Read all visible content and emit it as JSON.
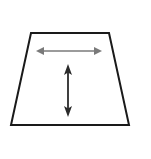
{
  "figure": {
    "type": "geometry-diagram",
    "canvas": {
      "width": 151,
      "height": 159,
      "background_color": "#ffffff"
    },
    "shape": {
      "name": "trapezoid",
      "kind": "isosceles trapezoid",
      "outline_color": "#1a1a1a",
      "fill_color": "#ffffff",
      "stroke_width": 2,
      "vertices": [
        {
          "label": "top-left",
          "x": 31,
          "y": 33
        },
        {
          "label": "top-right",
          "x": 109,
          "y": 33
        },
        {
          "label": "bottom-right",
          "x": 129,
          "y": 125
        },
        {
          "label": "bottom-left",
          "x": 11,
          "y": 125
        }
      ],
      "points_string": "31,33 109,33 129,125 11,125",
      "measurements": {
        "top_base_length_px": 78,
        "bottom_base_length_px": 118,
        "height_px": 92
      }
    },
    "arrows": [
      {
        "name": "width-arrow",
        "orientation": "horizontal",
        "double_headed": true,
        "color": "#7a7a7a",
        "shaft_width": 1.6,
        "head_length": 8,
        "head_half_width": 4,
        "start": {
          "x": 36,
          "y": 51
        },
        "end": {
          "x": 102,
          "y": 51
        },
        "length_px": 66,
        "meaning": "top width measure"
      },
      {
        "name": "height-arrow",
        "orientation": "vertical",
        "double_headed": true,
        "color": "#2b2b2b",
        "shaft_width": 1.8,
        "head_length": 10,
        "head_half_width": 4,
        "start": {
          "x": 68,
          "y": 64
        },
        "end": {
          "x": 68,
          "y": 117
        },
        "length_px": 53,
        "meaning": "height measure"
      }
    ],
    "labels": []
  }
}
